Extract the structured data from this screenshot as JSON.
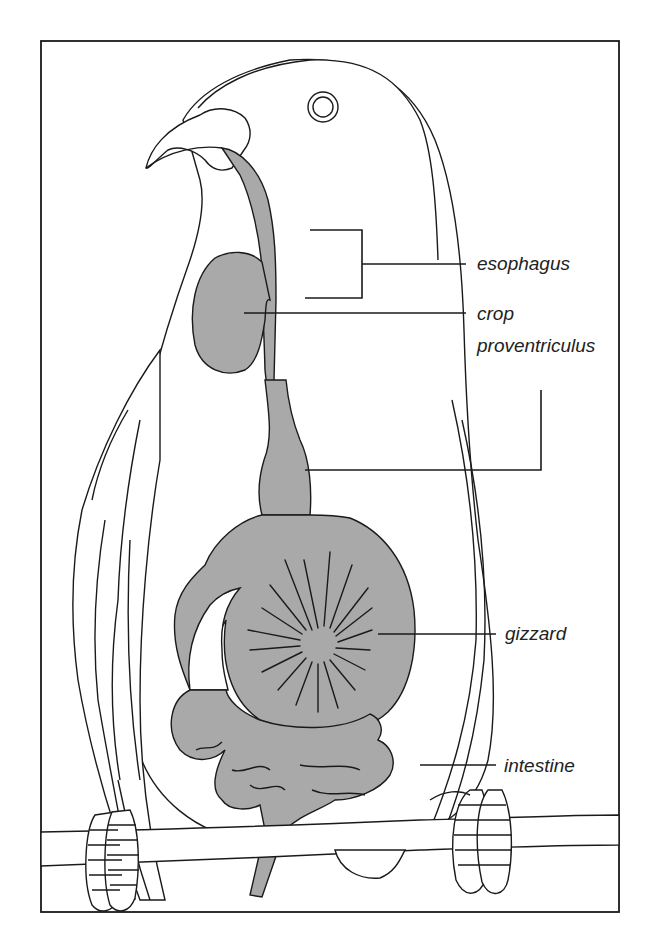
{
  "diagram": {
    "colors": {
      "organ_fill": "#a9a9a9",
      "line": "#1a1a1a",
      "background": "#ffffff"
    },
    "labels": [
      {
        "id": "esophagus",
        "text": "esophagus"
      },
      {
        "id": "crop",
        "text": "crop"
      },
      {
        "id": "proventriculus",
        "text": "proventriculus"
      },
      {
        "id": "gizzard",
        "text": "gizzard"
      },
      {
        "id": "intestine",
        "text": "intestine"
      }
    ]
  }
}
